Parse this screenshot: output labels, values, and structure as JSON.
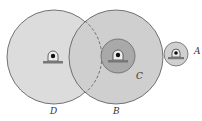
{
  "diagram": {
    "type": "gear-train",
    "labels": {
      "A": "A",
      "B": "B",
      "C": "C",
      "D": "D"
    },
    "colors": {
      "background": "#ffffff",
      "gear_D_fill": "#dcdcdc",
      "gear_B_fill": "#cfcfcf",
      "gear_C_fill": "#a9a9a9",
      "gear_A_fill": "#d0d0d0",
      "outline": "#555555"
    }
  }
}
